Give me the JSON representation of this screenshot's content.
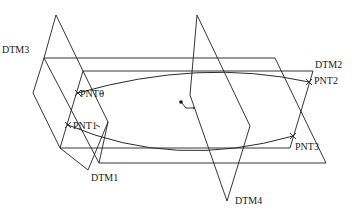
{
  "diagram": {
    "type": "datum-planes-and-points",
    "planes": [
      {
        "id": "dtm1",
        "label": "DTM1"
      },
      {
        "id": "dtm2",
        "label": "DTM2"
      },
      {
        "id": "dtm3",
        "label": "DTM3"
      },
      {
        "id": "dtm4",
        "label": "DTM4"
      }
    ],
    "points": [
      {
        "id": "pnt0",
        "label": "PNT0"
      },
      {
        "id": "pnt1",
        "label": "PNT1"
      },
      {
        "id": "pnt2",
        "label": "PNT2"
      },
      {
        "id": "pnt3",
        "label": "PNT3"
      }
    ],
    "curves": [
      {
        "from": "PNT0",
        "to": "PNT2"
      },
      {
        "from": "PNT1",
        "to": "PNT3"
      }
    ],
    "colors": {
      "line": "#1f1f1f",
      "background": "#ffffff"
    }
  }
}
